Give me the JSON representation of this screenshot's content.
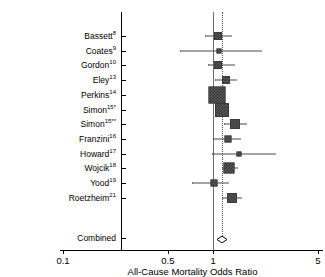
{
  "chart_data": {
    "type": "forest",
    "title": "",
    "xlabel": "All-Cause Mortality Odds Ratio",
    "ylabel": "",
    "xscale": "log",
    "xlim": [
      0.1,
      5
    ],
    "xticks": [
      0.1,
      0.5,
      1,
      5
    ],
    "xticklabels": [
      "0.1",
      "0.5",
      "1",
      "5"
    ],
    "grid": false,
    "reference_line": 1,
    "pooled_line": 1.14,
    "legend": "none",
    "categories": [
      "Bassett",
      "Coates",
      "Gordon",
      "Eley",
      "Perkins",
      "Simon",
      "Simon",
      "Franzini",
      "Howard",
      "Wojcik",
      "Yood",
      "Roetzheim",
      "Combined"
    ],
    "studies": [
      {
        "label": "Bassett",
        "ref": "8",
        "or": 1.08,
        "ci_low": 0.89,
        "ci_high": 1.31,
        "weight": 0.3
      },
      {
        "label": "Coates",
        "ref": "9",
        "or": 1.1,
        "ci_low": 0.6,
        "ci_high": 2.1,
        "weight": 0.1
      },
      {
        "label": "Gordon",
        "ref": "10",
        "or": 1.08,
        "ci_low": 0.92,
        "ci_high": 1.38,
        "weight": 0.3
      },
      {
        "label": "Eley",
        "ref": "13",
        "or": 1.22,
        "ci_low": 1.03,
        "ci_high": 1.42,
        "weight": 0.32
      },
      {
        "label": "Perkins",
        "ref": "14",
        "or": 1.06,
        "ci_low": 0.97,
        "ci_high": 1.16,
        "weight": 0.95
      },
      {
        "label": "Simon",
        "ref": "15",
        "marker": "*",
        "or": 1.14,
        "ci_low": 1.04,
        "ci_high": 1.25,
        "weight": 0.7
      },
      {
        "label": "Simon",
        "ref": "15",
        "marker": "**",
        "or": 1.4,
        "ci_low": 1.18,
        "ci_high": 1.65,
        "weight": 0.45
      },
      {
        "label": "Franzini",
        "ref": "16",
        "or": 1.26,
        "ci_low": 1.0,
        "ci_high": 1.5,
        "weight": 0.22
      },
      {
        "label": "Howard",
        "ref": "17",
        "or": 1.48,
        "ci_low": 0.99,
        "ci_high": 2.6,
        "weight": 0.08
      },
      {
        "label": "Wojcik",
        "ref": "18",
        "or": 1.28,
        "ci_low": 1.15,
        "ci_high": 1.44,
        "weight": 0.5
      },
      {
        "label": "Yood",
        "ref": "19",
        "or": 1.02,
        "ci_low": 0.72,
        "ci_high": 1.26,
        "weight": 0.2
      },
      {
        "label": "Roetzheim",
        "ref": "21",
        "or": 1.33,
        "ci_low": 1.14,
        "ci_high": 1.53,
        "weight": 0.44
      }
    ],
    "combined": {
      "label": "Combined",
      "or": 1.14,
      "ci_low": 1.08,
      "ci_high": 1.21
    }
  },
  "axis": {
    "xlabel": "All-Cause Mortality Odds Ratio",
    "tick_0": "0.1",
    "tick_1": "0.5",
    "tick_2": "1",
    "tick_3": "5"
  },
  "rows": [
    {
      "name": "Bassett",
      "sup": "8"
    },
    {
      "name": "Coates",
      "sup": "9"
    },
    {
      "name": "Gordon",
      "sup": "10"
    },
    {
      "name": "Eley",
      "sup": "13"
    },
    {
      "name": "Perkins",
      "sup": "14"
    },
    {
      "name": "Simon",
      "sup": "15",
      "mark": "*"
    },
    {
      "name": "Simon",
      "sup": "15",
      "mark": "**"
    },
    {
      "name": "Franzini",
      "sup": "16"
    },
    {
      "name": "Howard",
      "sup": "17"
    },
    {
      "name": "Wojcik",
      "sup": "18"
    },
    {
      "name": "Yood",
      "sup": "19"
    },
    {
      "name": "Roetzheim",
      "sup": "21"
    },
    {
      "name": "Combined",
      "sup": ""
    }
  ]
}
